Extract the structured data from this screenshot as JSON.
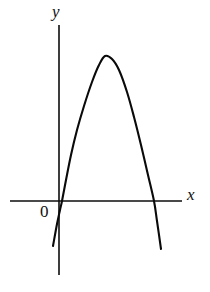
{
  "figure": {
    "background_color": "#ffffff",
    "stroke_color": "#0a0a0a"
  },
  "labels": {
    "y_axis": "y",
    "x_axis": "x",
    "origin": "0"
  },
  "chart_data": {
    "type": "line",
    "title": "",
    "subtitle": "",
    "xlabel": "x",
    "ylabel": "y",
    "grid": false,
    "legend": null,
    "annotations": [
      "0"
    ],
    "axes": {
      "x_axis_pixel_y": 201,
      "y_axis_pixel_x": 59,
      "x_axis_extent_px": [
        10,
        182
      ],
      "y_axis_extent_px": [
        25,
        275
      ],
      "origin_px": [
        59,
        201
      ]
    },
    "series": [
      {
        "name": "parabola",
        "shape": "downward-opening parabola",
        "vertex_px": [
          105,
          56
        ],
        "roots_px": [
          [
            62,
            201
          ],
          [
            154,
            201
          ]
        ],
        "endpoints_px": [
          [
            53,
            246
          ],
          [
            161,
            249
          ]
        ],
        "points_px": [
          [
            53,
            246
          ],
          [
            57,
            224
          ],
          [
            60,
            210
          ],
          [
            62,
            201
          ],
          [
            66,
            180
          ],
          [
            71,
            155
          ],
          [
            77,
            130
          ],
          [
            84,
            106
          ],
          [
            92,
            82
          ],
          [
            99,
            65
          ],
          [
            105,
            56
          ],
          [
            112,
            59
          ],
          [
            119,
            70
          ],
          [
            127,
            92
          ],
          [
            134,
            117
          ],
          [
            141,
            145
          ],
          [
            148,
            175
          ],
          [
            154,
            201
          ],
          [
            157,
            221
          ],
          [
            161,
            249
          ]
        ]
      }
    ]
  }
}
